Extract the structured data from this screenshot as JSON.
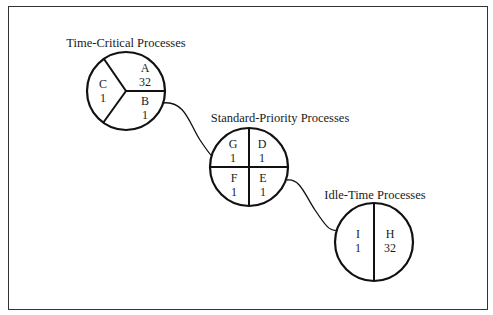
{
  "diagram": {
    "groups": [
      {
        "title": "Time-Critical Processes",
        "partitions": [
          {
            "name": "A",
            "value": "32"
          },
          {
            "name": "B",
            "value": "1"
          },
          {
            "name": "C",
            "value": "1"
          }
        ]
      },
      {
        "title": "Standard-Priority Processes",
        "partitions": [
          {
            "name": "G",
            "value": "1"
          },
          {
            "name": "D",
            "value": "1"
          },
          {
            "name": "F",
            "value": "1"
          },
          {
            "name": "E",
            "value": "1"
          }
        ]
      },
      {
        "title": "Idle-Time Processes",
        "partitions": [
          {
            "name": "I",
            "value": "1"
          },
          {
            "name": "H",
            "value": "32"
          }
        ]
      }
    ],
    "colors": {
      "stroke": "#111111",
      "background": "#ffffff"
    }
  }
}
